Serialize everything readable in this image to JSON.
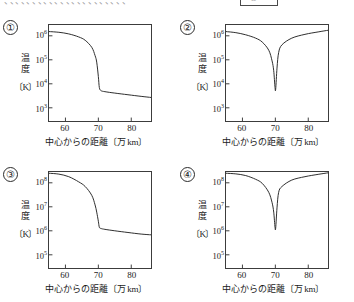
{
  "top_strip": {
    "clipped_text": "、、、、、、、、、、、、、、、、、、、、、、",
    "clipped_box_label": "⑤"
  },
  "axes_common": {
    "y_title_line1": "温",
    "y_title_line2": "度",
    "y_unit": "〔K〕",
    "x_title": "中心からの距離",
    "x_unit": "〔万 km〕",
    "x_ticks": [
      "60",
      "70",
      "80"
    ],
    "x_tick_values": [
      60,
      70,
      80
    ],
    "x_min": 55,
    "x_max": 86
  },
  "panels": [
    {
      "number": "①",
      "y_ticks": [
        "10",
        "10",
        "10",
        "10"
      ],
      "y_tick_exponents": [
        "6",
        "5",
        "4",
        "3"
      ],
      "y_tick_values": [
        1000000,
        100000,
        10000,
        1000
      ],
      "y_min_exp": 2.45,
      "y_max_exp": 6.45,
      "shape": "monotonic-drop"
    },
    {
      "number": "②",
      "y_ticks": [
        "10",
        "10",
        "10",
        "10"
      ],
      "y_tick_exponents": [
        "6",
        "5",
        "4",
        "3"
      ],
      "y_tick_values": [
        1000000,
        100000,
        10000,
        1000
      ],
      "y_min_exp": 2.45,
      "y_max_exp": 6.45,
      "shape": "v-dip"
    },
    {
      "number": "③",
      "y_ticks": [
        "10",
        "10",
        "10",
        "10"
      ],
      "y_tick_exponents": [
        "8",
        "7",
        "6",
        "5"
      ],
      "y_tick_values": [
        100000000,
        10000000,
        1000000,
        100000
      ],
      "y_min_exp": 4.45,
      "y_max_exp": 8.45,
      "shape": "monotonic-drop"
    },
    {
      "number": "④",
      "y_ticks": [
        "10",
        "10",
        "10",
        "10"
      ],
      "y_tick_exponents": [
        "8",
        "7",
        "6",
        "5"
      ],
      "y_tick_values": [
        100000000,
        10000000,
        1000000,
        100000
      ],
      "y_min_exp": 4.45,
      "y_max_exp": 8.45,
      "shape": "v-dip"
    }
  ],
  "chart_data": {
    "type": "line",
    "title": "",
    "xlabel": "中心からの距離〔万 km〕",
    "ylabel": "温度〔K〕",
    "yscale": "log",
    "xlim": [
      55,
      86
    ],
    "grid": false,
    "legend": "none",
    "panels": [
      {
        "name": "①",
        "ylim": [
          282,
          2818382
        ],
        "ytick_labels": [
          "10^6",
          "10^5",
          "10^4",
          "10^3"
        ],
        "xtick_labels": [
          "60",
          "70",
          "80"
        ],
        "description": "単調減少: 中心から約70万kmで急落し、その後ほぼ一定",
        "x": [
          55,
          58,
          61,
          64,
          66,
          68,
          69,
          69.5,
          70,
          70.3,
          70.8,
          72,
          75,
          79,
          83,
          86
        ],
        "y": [
          1500000,
          1400000,
          1200000,
          900000,
          650000,
          330000,
          150000,
          80000,
          20000,
          7000,
          5200,
          4700,
          4100,
          3500,
          3000,
          2700
        ]
      },
      {
        "name": "②",
        "ylim": [
          282,
          2818382
        ],
        "ytick_labels": [
          "10^6",
          "10^5",
          "10^4",
          "10^3"
        ],
        "xtick_labels": [
          "60",
          "70",
          "80"
        ],
        "description": "約70万kmで最小値まで急降下し、その後急上昇するV字型",
        "x": [
          55,
          58,
          61,
          64,
          66,
          68,
          69,
          69.5,
          69.9,
          70.1,
          70.5,
          71,
          72,
          75,
          79,
          83,
          86
        ],
        "y": [
          1500000,
          1350000,
          1100000,
          800000,
          550000,
          250000,
          90000,
          35000,
          7000,
          6000,
          45000,
          200000,
          420000,
          800000,
          1150000,
          1450000,
          1700000
        ]
      },
      {
        "name": "③",
        "ylim": [
          28184,
          281838293
        ],
        "ytick_labels": [
          "10^8",
          "10^7",
          "10^6",
          "10^5"
        ],
        "xtick_labels": [
          "60",
          "70",
          "80"
        ],
        "description": "単調減少: 中心から約70万kmで急落し、その後ほぼ一定",
        "x": [
          55,
          58,
          61,
          64,
          66,
          68,
          69,
          69.5,
          70,
          70.3,
          70.8,
          72,
          75,
          79,
          83,
          86
        ],
        "y": [
          250000000,
          230000000,
          180000000,
          110000000,
          70000000,
          30000000,
          12000000,
          6000000,
          2500000,
          1400000,
          1250000,
          1150000,
          1000000,
          850000,
          730000,
          680000
        ]
      },
      {
        "name": "④",
        "ylim": [
          28184,
          281838293
        ],
        "ytick_labels": [
          "10^8",
          "10^7",
          "10^6",
          "10^5"
        ],
        "xtick_labels": [
          "60",
          "70",
          "80"
        ],
        "description": "約70万kmで最小値まで急降下し、その後急上昇するV字型",
        "x": [
          55,
          58,
          61,
          64,
          66,
          68,
          69,
          69.5,
          69.9,
          70.1,
          70.5,
          71,
          72,
          75,
          79,
          83,
          86
        ],
        "y": [
          250000000,
          235000000,
          200000000,
          140000000,
          95000000,
          40000000,
          15000000,
          6000000,
          1400000,
          1300000,
          9000000,
          40000000,
          70000000,
          130000000,
          180000000,
          225000000,
          260000000
        ]
      }
    ]
  }
}
